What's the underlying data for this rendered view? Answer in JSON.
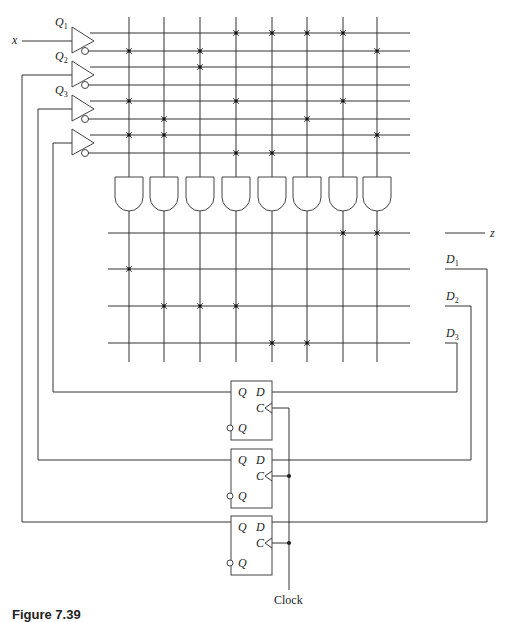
{
  "diagram": {
    "type": "PLA sequential circuit",
    "inputs": [
      {
        "name": "x",
        "label": "x",
        "sub": ""
      },
      {
        "name": "Q1",
        "label": "Q",
        "sub": "1"
      },
      {
        "name": "Q2",
        "label": "Q",
        "sub": "2"
      },
      {
        "name": "Q3",
        "label": "Q",
        "sub": "3"
      }
    ],
    "and_plane": {
      "rows": [
        "x",
        "x'",
        "Q1",
        "Q1'",
        "Q2",
        "Q2'",
        "Q3",
        "Q3'"
      ],
      "product_terms": 8,
      "connections": [
        [
          3,
          4,
          5,
          6
        ],
        [
          0,
          2,
          7
        ],
        [
          2
        ],
        [],
        [
          0,
          3,
          6
        ],
        [
          1,
          5
        ],
        [
          0,
          1,
          7
        ],
        [
          3,
          4
        ]
      ]
    },
    "or_plane": {
      "outputs": [
        {
          "name": "z",
          "label": "z",
          "sub": "",
          "terms": [
            6,
            7
          ]
        },
        {
          "name": "D1",
          "label": "D",
          "sub": "1",
          "terms": [
            0
          ]
        },
        {
          "name": "D2",
          "label": "D",
          "sub": "2",
          "terms": [
            1,
            2,
            3
          ]
        },
        {
          "name": "D3",
          "label": "D",
          "sub": "3",
          "terms": [
            4,
            5
          ]
        }
      ]
    },
    "flip_flops": [
      {
        "name": "FF3",
        "q": "Q",
        "d": "D",
        "c": "C",
        "qbar": "Q"
      },
      {
        "name": "FF2",
        "q": "Q",
        "d": "D",
        "c": "C",
        "qbar": "Q"
      },
      {
        "name": "FF1",
        "q": "Q",
        "d": "D",
        "c": "C",
        "qbar": "Q"
      }
    ],
    "clock_label": "Clock",
    "caption": "Figure 7.39"
  }
}
